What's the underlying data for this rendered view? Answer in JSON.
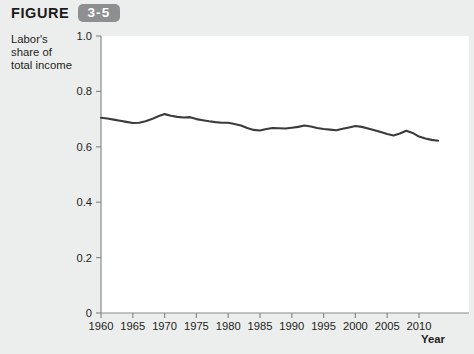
{
  "figure": {
    "label": "FIGURE",
    "number": "3-5"
  },
  "axis_caption": {
    "line1": "Labor's",
    "line2": "share of",
    "line3": "total income"
  },
  "x_axis_title": "Year",
  "colors": {
    "page_background": "#eceded",
    "panel_background": "#ffffff",
    "line": "#3b3b3c",
    "axis": "#8a8a8a",
    "badge": "#8e8f91",
    "badge_text": "#ffffff",
    "text": "#231f20"
  },
  "chart_data": {
    "type": "line",
    "title": "",
    "xlabel": "Year",
    "ylabel": "Labor's share of total income",
    "xlim": [
      1960,
      2013
    ],
    "ylim": [
      0,
      1.0
    ],
    "grid": false,
    "legend": false,
    "yticks": [
      0,
      0.2,
      0.4,
      0.6,
      0.8,
      1.0
    ],
    "ytick_labels": [
      "0",
      "0.2",
      "0.4",
      "0.6",
      "0.8",
      "1.0"
    ],
    "xticks": [
      1960,
      1965,
      1970,
      1975,
      1980,
      1985,
      1990,
      1995,
      2000,
      2005,
      2010
    ],
    "xtick_labels": [
      "1960",
      "1965",
      "1970",
      "1975",
      "1980",
      "1985",
      "1990",
      "1995",
      "2000",
      "2005",
      "2010"
    ],
    "series": [
      {
        "name": "Labor's share of total income",
        "color": "#3b3b3c",
        "x": [
          1960,
          1961,
          1962,
          1963,
          1964,
          1965,
          1966,
          1967,
          1968,
          1969,
          1970,
          1971,
          1972,
          1973,
          1974,
          1975,
          1976,
          1977,
          1978,
          1979,
          1980,
          1981,
          1982,
          1983,
          1984,
          1985,
          1986,
          1987,
          1988,
          1989,
          1990,
          1991,
          1992,
          1993,
          1994,
          1995,
          1996,
          1997,
          1998,
          1999,
          2000,
          2001,
          2002,
          2003,
          2004,
          2005,
          2006,
          2007,
          2008,
          2009,
          2010,
          2011,
          2012,
          2013
        ],
        "values": [
          0.705,
          0.702,
          0.698,
          0.694,
          0.69,
          0.686,
          0.687,
          0.692,
          0.7,
          0.71,
          0.718,
          0.712,
          0.708,
          0.706,
          0.707,
          0.7,
          0.696,
          0.692,
          0.689,
          0.687,
          0.687,
          0.682,
          0.677,
          0.668,
          0.661,
          0.659,
          0.664,
          0.668,
          0.667,
          0.666,
          0.669,
          0.672,
          0.677,
          0.673,
          0.668,
          0.664,
          0.662,
          0.66,
          0.665,
          0.67,
          0.675,
          0.672,
          0.666,
          0.66,
          0.653,
          0.646,
          0.641,
          0.648,
          0.658,
          0.65,
          0.637,
          0.63,
          0.625,
          0.622
        ]
      }
    ]
  }
}
